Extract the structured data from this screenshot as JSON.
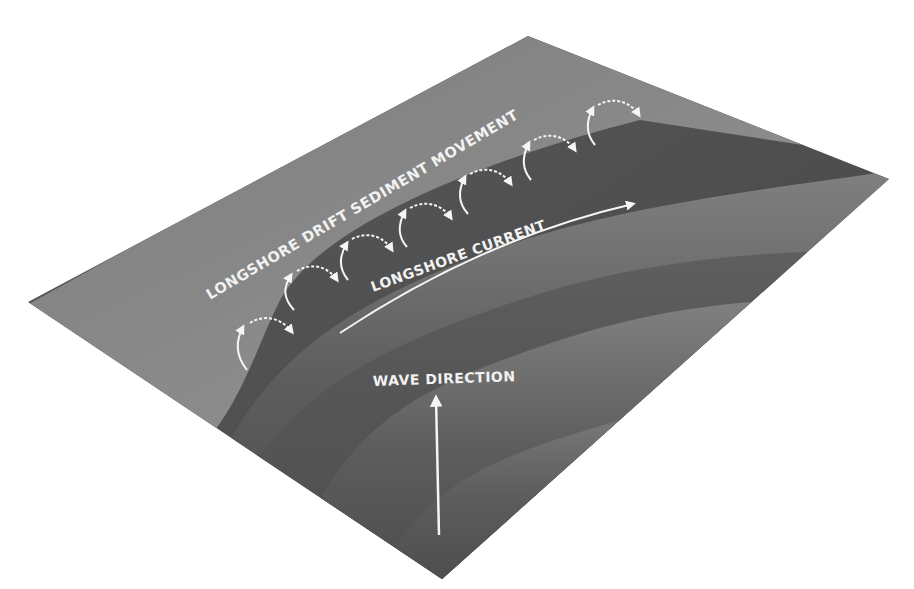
{
  "diagram": {
    "labels": {
      "drift": "LONGSHORE DRIFT SEDIMENT MOVEMENT",
      "current": "LONGSHORE CURRENT",
      "wave": "WAVE DIRECTION"
    },
    "colors": {
      "background": "#ffffff",
      "beach": "#8a8a8a",
      "sea_dark": "#505050",
      "wave_crest": "#7a7a7a",
      "label": "#f2f2f2",
      "arrow": "#f5f5f5"
    },
    "plane_corners": {
      "left": [
        28,
        302
      ],
      "top": [
        528,
        36
      ],
      "right": [
        889,
        179
      ],
      "bottom": [
        442,
        579
      ]
    },
    "drift_arrows_count": 7
  }
}
